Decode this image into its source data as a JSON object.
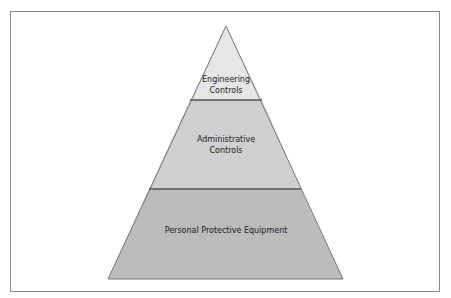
{
  "diagram": {
    "type": "hierarchy-pyramid",
    "colors": {
      "top_fill": "#e8e8e8",
      "middle_fill": "#d2d2d2",
      "bottom_fill": "#bdbdbd",
      "outline": "#6a6a6a",
      "divider": "#5a5a5a",
      "frame": "#8a8a8a"
    },
    "levels": [
      {
        "line1": "Engineering",
        "line2": "Controls"
      },
      {
        "line1": "Administrative",
        "line2": "Controls"
      },
      {
        "line1": "Personal Protective Equipment",
        "line2": ""
      }
    ]
  }
}
